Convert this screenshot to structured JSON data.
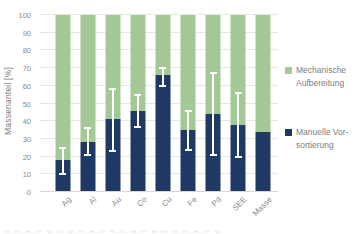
{
  "chart_data": {
    "type": "bar",
    "stacked": true,
    "title": "",
    "xlabel": "",
    "ylabel": "Massenanteil [%]",
    "ylim": [
      0,
      100
    ],
    "yticks": [
      0,
      10,
      20,
      30,
      40,
      50,
      60,
      70,
      80,
      90,
      100
    ],
    "grid": "horizontal",
    "legend_position": "right",
    "categories": [
      "Ag",
      "Al",
      "Au",
      "Co",
      "Cu",
      "Fe",
      "Pd",
      "SEE",
      "Masse"
    ],
    "series": [
      {
        "name": "Manuelle Vorsortierung",
        "position": "bottom",
        "color": "#1f3864",
        "values": [
          18,
          28,
          41,
          46,
          66,
          35,
          44,
          38,
          34
        ]
      },
      {
        "name": "Mechanische Aufbereitung",
        "position": "top",
        "color": "#a5c996",
        "values": [
          82,
          72,
          59,
          54,
          34,
          65,
          56,
          62,
          66
        ]
      }
    ],
    "error_bars": {
      "on_series": "Manuelle Vorsortierung",
      "color": "#ffffff",
      "low": [
        10,
        21,
        23,
        37,
        60,
        24,
        21,
        20,
        null
      ],
      "high": [
        25,
        36,
        58,
        55,
        70,
        46,
        67,
        56,
        null
      ]
    }
  },
  "legend": {
    "items": [
      {
        "label_lines": [
          "Mechanische",
          "Aufbereitung"
        ],
        "color": "#a5c996",
        "top": 0
      },
      {
        "label_lines": [
          "Manuelle Vor-",
          "sortierung"
        ],
        "color": "#1f3864",
        "top": 62
      }
    ]
  },
  "colors": {
    "background": "#ffffff",
    "gridline": "#e7e7e7",
    "axis_line": "#d6d6d6",
    "text": "#808080",
    "error_bar": "#ffffff"
  }
}
